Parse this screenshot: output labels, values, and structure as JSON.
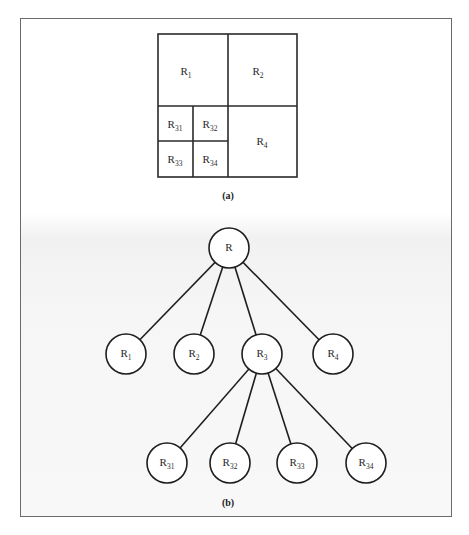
{
  "figure": {
    "part_a": {
      "caption": "(a)",
      "regions": [
        {
          "id": "R1",
          "base": "R",
          "sub": "1"
        },
        {
          "id": "R2",
          "base": "R",
          "sub": "2"
        },
        {
          "id": "R31",
          "base": "R",
          "sub": "31"
        },
        {
          "id": "R32",
          "base": "R",
          "sub": "32"
        },
        {
          "id": "R33",
          "base": "R",
          "sub": "33"
        },
        {
          "id": "R34",
          "base": "R",
          "sub": "34"
        },
        {
          "id": "R4",
          "base": "R",
          "sub": "4"
        }
      ]
    },
    "part_b": {
      "caption": "(b)",
      "nodes": [
        {
          "id": "R",
          "base": "R",
          "sub": "",
          "parent": null
        },
        {
          "id": "R1",
          "base": "R",
          "sub": "1",
          "parent": "R"
        },
        {
          "id": "R2",
          "base": "R",
          "sub": "2",
          "parent": "R"
        },
        {
          "id": "R3",
          "base": "R",
          "sub": "3",
          "parent": "R"
        },
        {
          "id": "R4",
          "base": "R",
          "sub": "4",
          "parent": "R"
        },
        {
          "id": "R31",
          "base": "R",
          "sub": "31",
          "parent": "R3"
        },
        {
          "id": "R32",
          "base": "R",
          "sub": "32",
          "parent": "R3"
        },
        {
          "id": "R33",
          "base": "R",
          "sub": "33",
          "parent": "R3"
        },
        {
          "id": "R34",
          "base": "R",
          "sub": "34",
          "parent": "R3"
        }
      ]
    }
  }
}
